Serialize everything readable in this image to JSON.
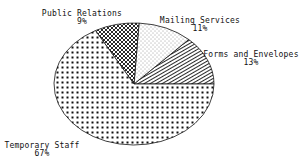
{
  "chart_data": {
    "type": "pie",
    "title": "",
    "categories": [
      "Forms and Envelopes",
      "Mailing Services",
      "Public Relations",
      "Temporary Staff"
    ],
    "values": [
      13,
      11,
      9,
      67
    ],
    "value_unit": "%",
    "start_angle_deg": 0,
    "direction": "counterclockwise",
    "legend": "none (direct labels)",
    "slices": [
      {
        "label": "Forms and Envelopes",
        "percent_label": "13%",
        "value": 13,
        "pattern": "diagonal-lines"
      },
      {
        "label": "Mailing Services",
        "percent_label": "11%",
        "value": 11,
        "pattern": "fine-dots"
      },
      {
        "label": "Public Relations",
        "percent_label": "9%",
        "value": 9,
        "pattern": "crosshatch"
      },
      {
        "label": "Temporary Staff",
        "percent_label": "67%",
        "value": 67,
        "pattern": "large-dots"
      }
    ]
  },
  "colors": {
    "ink": "#111111",
    "background": "#ffffff"
  }
}
